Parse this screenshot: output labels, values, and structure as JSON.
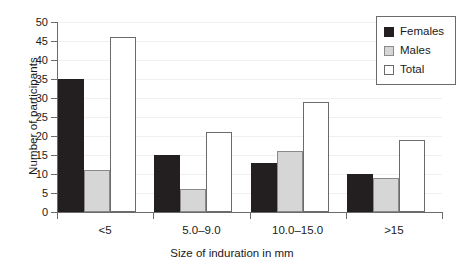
{
  "chart_data": {
    "type": "bar",
    "title": "",
    "subtitle": "",
    "xlabel": "Size of induration in mm",
    "ylabel": "Number of participants",
    "categories": [
      "<5",
      "5.0–9.0",
      "10.0–15.0",
      ">15"
    ],
    "series": [
      {
        "name": "Females",
        "values": [
          35,
          15,
          13,
          10
        ],
        "color": "#231f20"
      },
      {
        "name": "Males",
        "values": [
          11,
          6,
          16,
          9
        ],
        "color": "#d6d6d6"
      },
      {
        "name": "Total",
        "values": [
          46,
          21,
          29,
          19
        ],
        "color": "#ffffff"
      }
    ],
    "ylim": [
      0,
      50
    ],
    "ytick_values": [
      0,
      5,
      10,
      15,
      20,
      25,
      30,
      35,
      40,
      45,
      50
    ],
    "ytick_labels": [
      "0",
      "5",
      "10",
      "15",
      "20",
      "25",
      "30",
      "35",
      "40",
      "45",
      "50"
    ],
    "grid": true,
    "grid_axis": "y",
    "legend_position": "upper right",
    "legend_entries": [
      "Females",
      "Males",
      "Total"
    ],
    "annotations": []
  },
  "axes": {
    "y_title": "Number of participants",
    "x_title": "Size of induration in mm"
  },
  "legend": {
    "items": [
      {
        "label": "Females",
        "swatch": "black-square-icon"
      },
      {
        "label": "Males",
        "swatch": "gray-square-icon"
      },
      {
        "label": "Total",
        "swatch": "white-square-icon"
      }
    ]
  },
  "ticks": {
    "y": [
      "50",
      "45",
      "40",
      "35",
      "30",
      "25",
      "20",
      "15",
      "10",
      "5",
      "0"
    ],
    "x": [
      "<5",
      "5.0–9.0",
      "10.0–15.0",
      ">15"
    ]
  }
}
